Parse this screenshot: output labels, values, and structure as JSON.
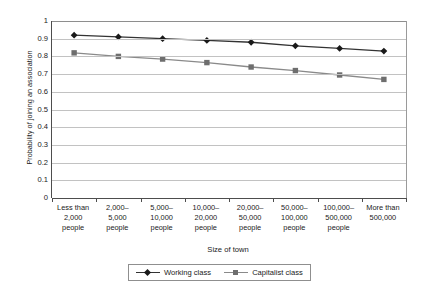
{
  "chart_data": {
    "type": "line",
    "title": "",
    "xlabel": "Size of town",
    "ylabel": "Probability of joining an association",
    "ylim": [
      0,
      1
    ],
    "ytick_step": 0.1,
    "grid": "horizontal",
    "legend_position": "bottom",
    "categories": [
      "Less than 2,000 people",
      "2,000–5,000 people",
      "5,000–10,000 people",
      "10,000–20,000 people",
      "20,000–50,000 people",
      "50,000–100,000 people",
      "100,000–500,000 people",
      "More than 500,000"
    ],
    "category_lines": [
      [
        "Less than",
        "2,000",
        "people"
      ],
      [
        "2,000–",
        "5,000",
        "people"
      ],
      [
        "5,000–",
        "10,000",
        "people"
      ],
      [
        "10,000–",
        "20,000",
        "people"
      ],
      [
        "20,000–",
        "50,000",
        "people"
      ],
      [
        "50,000–",
        "100,000",
        "people"
      ],
      [
        "100,000–",
        "500,000",
        "people"
      ],
      [
        "More than",
        "500,000"
      ]
    ],
    "ytick_labels": [
      "1",
      "0.9",
      "0.8",
      "0.7",
      "0.6",
      "0.5",
      "0.4",
      "0.3",
      "0.2",
      "0.1",
      "0"
    ],
    "ytick_values": [
      1,
      0.9,
      0.8,
      0.7,
      0.6,
      0.5,
      0.4,
      0.3,
      0.2,
      0.1,
      0
    ],
    "series": [
      {
        "name": "Working class",
        "marker": "diamond",
        "color": "#1a1a1a",
        "line_color": "#333333",
        "values": [
          0.92,
          0.91,
          0.9,
          0.89,
          0.88,
          0.86,
          0.845,
          0.83
        ]
      },
      {
        "name": "Capitalist class",
        "marker": "square",
        "color": "#6e6e6e",
        "line_color": "#8a8a8a",
        "values": [
          0.82,
          0.8,
          0.785,
          0.765,
          0.74,
          0.72,
          0.695,
          0.67
        ]
      }
    ]
  },
  "axes": {
    "y_title": "Probability of joining an association",
    "x_title": "Size of town"
  },
  "legend": {
    "entries": [
      {
        "label": "Working class"
      },
      {
        "label": "Capitalist class"
      }
    ]
  },
  "colors": {
    "series_1": "#1a1a1a",
    "series_2": "#6e6e6e",
    "gridline": "#c2c2c2",
    "axis": "#4d4d4d",
    "background": "#ffffff"
  }
}
